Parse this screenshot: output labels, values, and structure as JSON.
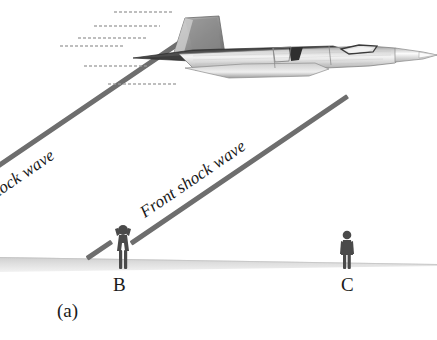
{
  "figure": {
    "caption": "(a)",
    "labels": {
      "rear_shock_wave": "n shock wave",
      "front_shock_wave": "Front shock wave",
      "point_b": "B",
      "point_c": "C"
    },
    "colors": {
      "shock_line": "#6e6e6e",
      "ground": "#d9d9d9",
      "person": "#4a4a4a",
      "jet_dark": "#3d3d3d",
      "jet_light": "#e8e8e8",
      "text": "#1a1a1a"
    },
    "icons": {
      "aircraft": "supersonic-jet-icon",
      "observer_covering_ears": "person-covering-ears-icon",
      "observer_standing": "person-standing-icon",
      "motion_lines": "speed-lines-icon",
      "ground": "ground-plane-icon"
    }
  }
}
